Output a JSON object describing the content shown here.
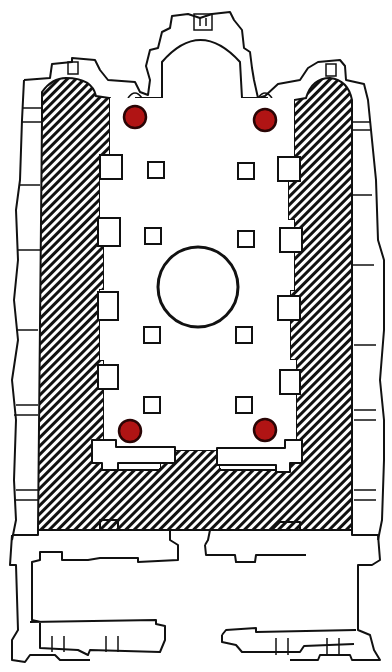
{
  "diagram": {
    "type": "architectural-floor-plan",
    "hatch_color": "#111111",
    "marker_color": "#b01414",
    "markers": [
      {
        "name": "marker-top-left",
        "position": "upper-left of nave"
      },
      {
        "name": "marker-top-right",
        "position": "upper-right of nave"
      },
      {
        "name": "marker-bottom-left",
        "position": "lower-left of nave"
      },
      {
        "name": "marker-bottom-right",
        "position": "lower-right of nave"
      }
    ],
    "elements": [
      "apse",
      "left-hatched-aisle",
      "right-hatched-aisle",
      "bottom-hatched-band",
      "central-dome",
      "interior-pillars",
      "narthex"
    ]
  }
}
